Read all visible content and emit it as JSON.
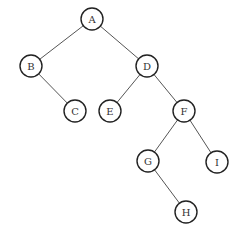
{
  "diagram": {
    "type": "binary-tree",
    "colors": {
      "edge": "#555555",
      "node_stroke": "#222222",
      "node_fill": "#ffffff",
      "label": "#333333"
    },
    "node_radius": 11,
    "nodes": [
      {
        "id": "A",
        "label": "A",
        "x": 92,
        "y": 19
      },
      {
        "id": "B",
        "label": "B",
        "x": 31,
        "y": 66
      },
      {
        "id": "C",
        "label": "C",
        "x": 75,
        "y": 111
      },
      {
        "id": "D",
        "label": "D",
        "x": 147,
        "y": 66
      },
      {
        "id": "E",
        "label": "E",
        "x": 110,
        "y": 111
      },
      {
        "id": "F",
        "label": "F",
        "x": 184,
        "y": 111
      },
      {
        "id": "G",
        "label": "G",
        "x": 148,
        "y": 161
      },
      {
        "id": "I",
        "label": "I",
        "x": 217,
        "y": 162
      },
      {
        "id": "H",
        "label": "H",
        "x": 186,
        "y": 212
      }
    ],
    "edges": [
      {
        "from": "A",
        "to": "B"
      },
      {
        "from": "A",
        "to": "D"
      },
      {
        "from": "B",
        "to": "C"
      },
      {
        "from": "D",
        "to": "E"
      },
      {
        "from": "D",
        "to": "F"
      },
      {
        "from": "F",
        "to": "G"
      },
      {
        "from": "F",
        "to": "I"
      },
      {
        "from": "G",
        "to": "H"
      }
    ]
  }
}
